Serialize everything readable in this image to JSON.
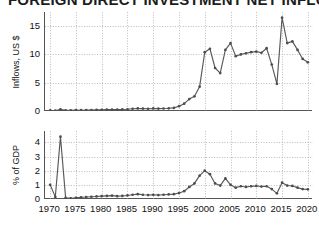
{
  "figure": {
    "title_clipped": "FOREIGN DIRECT INVESTMENT NET INFLOWS",
    "background": "#ffffff",
    "line_color": "#595959",
    "marker_color": "#4d4d4d",
    "grid_color": "#bdbdbd",
    "axis_color": "#555555"
  },
  "xaxis": {
    "ticks": [
      "1970",
      "1975",
      "1980",
      "1985",
      "1990",
      "1995",
      "2000",
      "2005",
      "2010",
      "2015",
      "2020"
    ],
    "min": 1969,
    "max": 2021
  },
  "chart_data": [
    {
      "type": "line",
      "panel": "top",
      "title": "",
      "xlabel": "",
      "ylabel": "Inflows, US $",
      "ylim": [
        0,
        17.5
      ],
      "yticks": [
        0,
        5,
        10,
        15
      ],
      "ytick_labels": [
        "0",
        "5",
        "10",
        "15"
      ],
      "grid": true,
      "legend": "none",
      "x": [
        1970,
        1971,
        1972,
        1973,
        1974,
        1975,
        1976,
        1977,
        1978,
        1979,
        1980,
        1981,
        1982,
        1983,
        1984,
        1985,
        1986,
        1987,
        1988,
        1989,
        1990,
        1991,
        1992,
        1993,
        1994,
        1995,
        1996,
        1997,
        1998,
        1999,
        2000,
        2001,
        2002,
        2003,
        2004,
        2005,
        2006,
        2007,
        2008,
        2009,
        2010,
        2011,
        2012,
        2013,
        2014,
        2015,
        2016,
        2017,
        2018,
        2019,
        2020
      ],
      "values": [
        0.1,
        0.05,
        0.3,
        0.12,
        0.1,
        0.15,
        0.14,
        0.16,
        0.18,
        0.2,
        0.22,
        0.24,
        0.26,
        0.25,
        0.27,
        0.3,
        0.4,
        0.45,
        0.42,
        0.4,
        0.45,
        0.42,
        0.44,
        0.48,
        0.55,
        0.85,
        1.3,
        2.1,
        2.6,
        4.3,
        10.4,
        11.0,
        7.6,
        6.7,
        10.8,
        12.0,
        9.7,
        10.0,
        10.2,
        10.4,
        10.5,
        10.3,
        11.1,
        8.2,
        4.8,
        16.5,
        12.0,
        12.3,
        10.8,
        9.2,
        8.6
      ]
    },
    {
      "type": "line",
      "panel": "bottom",
      "title": "",
      "xlabel": "",
      "ylabel": "% of GDP",
      "ylim": [
        0,
        4.8
      ],
      "yticks": [
        0,
        1,
        2,
        3,
        4
      ],
      "ytick_labels": [
        "0",
        "1",
        "2",
        "3",
        "4"
      ],
      "grid": true,
      "legend": "none",
      "x": [
        1970,
        1971,
        1972,
        1973,
        1974,
        1975,
        1976,
        1977,
        1978,
        1979,
        1980,
        1981,
        1982,
        1983,
        1984,
        1985,
        1986,
        1987,
        1988,
        1989,
        1990,
        1991,
        1992,
        1993,
        1994,
        1995,
        1996,
        1997,
        1998,
        1999,
        2000,
        2001,
        2002,
        2003,
        2004,
        2005,
        2006,
        2007,
        2008,
        2009,
        2010,
        2011,
        2012,
        2013,
        2014,
        2015,
        2016,
        2017,
        2018,
        2019,
        2020
      ],
      "values": [
        1.0,
        0.15,
        4.4,
        0.08,
        0.05,
        0.08,
        0.12,
        0.14,
        0.16,
        0.18,
        0.2,
        0.22,
        0.24,
        0.2,
        0.22,
        0.25,
        0.3,
        0.34,
        0.3,
        0.28,
        0.3,
        0.28,
        0.3,
        0.32,
        0.34,
        0.42,
        0.55,
        0.85,
        1.1,
        1.65,
        2.0,
        1.75,
        1.1,
        0.95,
        1.45,
        1.0,
        0.8,
        0.9,
        0.85,
        0.9,
        0.92,
        0.88,
        0.9,
        0.7,
        0.4,
        1.15,
        0.95,
        0.92,
        0.8,
        0.7,
        0.68
      ]
    }
  ]
}
